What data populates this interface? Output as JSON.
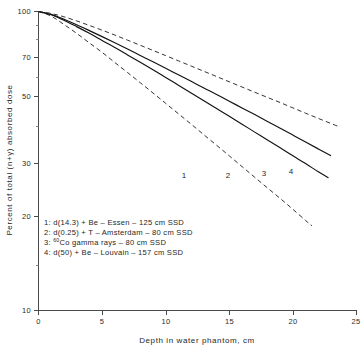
{
  "chart_data": {
    "type": "line",
    "title": "",
    "xlabel": "Depth in water phantom,    cm",
    "ylabel": "Percent of total (n+γ) absorbed dose",
    "xlim": [
      0,
      25
    ],
    "ylim": [
      10,
      100
    ],
    "yscale": "log",
    "grid": false,
    "legend_position": "inside-lower-left",
    "xticks": [
      0,
      5,
      10,
      15,
      20,
      25
    ],
    "xtick_labels": [
      "0",
      "5",
      "10",
      "15",
      "20",
      "25"
    ],
    "yticks": [
      100,
      70,
      50,
      30,
      20,
      10
    ],
    "ytick_labels": [
      "100",
      "70",
      "50",
      "30",
      "20",
      "10"
    ],
    "yminor_ticks": [
      90,
      80,
      60,
      40,
      15
    ],
    "series": [
      {
        "name": "1",
        "label": "1: d(14.3) + Be - Essen - 125 cm SSD",
        "style": "dashed",
        "curve_label": "1",
        "x": [
          0,
          1,
          2,
          3,
          4,
          5,
          6,
          7,
          8,
          9,
          10,
          11,
          12,
          13,
          14,
          15,
          16,
          17,
          18,
          19,
          20,
          21,
          21.5
        ],
        "y": [
          100,
          96.5,
          90.5,
          84.5,
          78.5,
          73.0,
          67.5,
          62.5,
          57.8,
          53.4,
          49.3,
          45.5,
          42.0,
          38.7,
          35.7,
          32.9,
          30.3,
          27.9,
          25.7,
          23.7,
          21.8,
          20.0,
          19.2
        ]
      },
      {
        "name": "2",
        "label": "2: d(0.25) + T - Amsterdam - 80 cm SSD",
        "style": "solid",
        "curve_label": "2",
        "x": [
          0,
          1,
          2,
          3,
          4,
          5,
          6,
          7,
          8,
          9,
          10,
          11,
          12,
          13,
          14,
          15,
          16,
          17,
          18,
          19,
          20,
          21,
          22,
          22.8
        ],
        "y": [
          100,
          97.5,
          93.5,
          89.0,
          84.5,
          80.0,
          75.8,
          71.6,
          67.6,
          63.8,
          60.2,
          56.7,
          53.4,
          50.3,
          47.4,
          44.6,
          42.0,
          39.5,
          37.2,
          35.0,
          32.9,
          31.0,
          29.1,
          27.8
        ]
      },
      {
        "name": "3",
        "label": "3: 60Co gamma rays - 80 cm SSD",
        "label_prefix": "3: ",
        "label_sup": "60",
        "label_rest": "Co gamma rays - 80 cm SSD",
        "style": "solid",
        "curve_label": "3",
        "x": [
          0,
          1,
          2,
          3,
          4,
          5,
          6,
          7,
          8,
          9,
          10,
          11,
          12,
          13,
          14,
          15,
          16,
          17,
          18,
          19,
          20,
          21,
          22,
          23
        ],
        "y": [
          100,
          97.8,
          94.2,
          90.3,
          86.3,
          82.4,
          78.6,
          74.9,
          71.3,
          67.9,
          64.6,
          61.4,
          58.4,
          55.5,
          52.8,
          50.1,
          47.6,
          45.2,
          42.9,
          40.7,
          38.6,
          36.6,
          34.7,
          32.9
        ]
      },
      {
        "name": "4",
        "label": "4: d(50) + Be - Louvain - 157 cm SSD",
        "style": "dashed",
        "curve_label": "4",
        "x": [
          0,
          1,
          2,
          3,
          4,
          5,
          6,
          7,
          8,
          9,
          10,
          11,
          12,
          13,
          14,
          15,
          16,
          17,
          18,
          19,
          20,
          21,
          22,
          23,
          23.6
        ],
        "y": [
          100,
          98.5,
          96.0,
          93.0,
          89.8,
          86.6,
          83.4,
          80.2,
          77.1,
          74.1,
          71.2,
          68.4,
          65.7,
          63.1,
          60.6,
          58.2,
          55.9,
          53.7,
          51.6,
          49.6,
          47.6,
          45.7,
          43.9,
          42.2,
          41.2
        ]
      }
    ],
    "legend_entries": [
      "1: d(14.3) + Be - Essen - 125 cm SSD",
      "2: d(0.25) + T - Amsterdam - 80 cm SSD",
      "3: 60Co gamma rays - 80 cm SSD",
      "4: d(50) + Be - Louvain - 157 cm SSD"
    ]
  },
  "legend": {
    "line1": "1: d(14.3) + Be – Essen – 125 cm  SSD",
    "line2": "2: d(0.25) + T – Amsterdam – 80 cm  SSD",
    "line3_prefix": "3: ",
    "line3_sup": "60",
    "line3_rest": "Co gamma rays – 80 cm  SSD",
    "line4": "4: d(50) + Be – Louvain – 157 cm  SSD"
  },
  "axes": {
    "x_title": "Depth in water phantom,    cm",
    "y_title": "Percent of total (n+γ) absorbed dose",
    "x_tick_0": "0",
    "x_tick_1": "5",
    "x_tick_2": "10",
    "x_tick_3": "15",
    "x_tick_4": "20",
    "x_tick_5": "25",
    "y_tick_0": "100",
    "y_tick_1": "70",
    "y_tick_2": "50",
    "y_tick_3": "30",
    "y_tick_4": "20",
    "y_tick_5": "10"
  },
  "curve_labels": {
    "c1": "1",
    "c2": "2",
    "c3": "3",
    "c4": "4"
  },
  "colors": {
    "ink": "#111111",
    "axis": "#4a4a4a",
    "background": "#ffffff"
  }
}
